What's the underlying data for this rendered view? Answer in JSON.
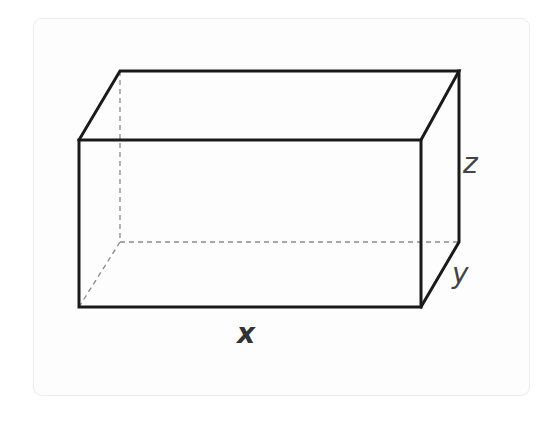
{
  "figure": {
    "type": "rectangular-prism",
    "labels": {
      "x": "x",
      "y": "y",
      "z": "z"
    },
    "colors": {
      "edge": "#1a1a1a",
      "hidden_edge": "#888888",
      "card_border": "#ececec",
      "background": "#ffffff"
    }
  }
}
